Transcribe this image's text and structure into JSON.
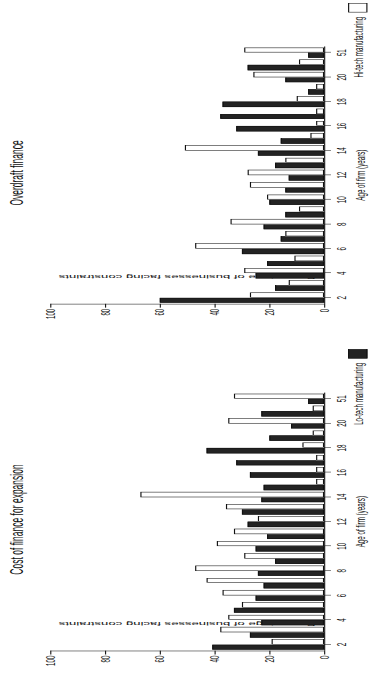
{
  "figure": {
    "panels": [
      {
        "id": "overdraft",
        "title": "Overdraft finance",
        "xlabel": "Age of firm (years)",
        "ylabel": "Percentage of businesses facing constraints",
        "legend": {
          "label": "Hi-tech manufacturing",
          "swatch": "stipple-pattern-swatch"
        }
      },
      {
        "id": "cost-of-finance",
        "title": "Cost of finance for expansion",
        "xlabel": "Age of firm (years)",
        "ylabel": "Percentage of businesses facing constraints",
        "legend": {
          "label": "Lo-tech manufacturing",
          "swatch": "solid-black-swatch"
        }
      }
    ]
  },
  "chart_data": [
    {
      "type": "bar",
      "id": "overdraft",
      "title": "Overdraft finance",
      "xlabel": "Age of firm (years)",
      "ylabel": "Percentage of businesses facing constraints",
      "ylim": [
        0,
        100
      ],
      "yticks": [
        0,
        20,
        40,
        60,
        80,
        100
      ],
      "grid": false,
      "legend_position": "right",
      "categories": [
        "2",
        "3",
        "4",
        "5",
        "6",
        "7",
        "8",
        "9",
        "10",
        "11",
        "12",
        "13",
        "14",
        "15",
        "16",
        "17",
        "18",
        "19",
        "20",
        "21",
        "51"
      ],
      "labelled_ticks": [
        "2",
        "4",
        "6",
        "8",
        "10",
        "12",
        "14",
        "16",
        "18",
        "20",
        "51"
      ],
      "series": [
        {
          "name": "Lo-tech manufacturing",
          "color": "#232323",
          "values": [
            60,
            18,
            25,
            21,
            30,
            16,
            22,
            14,
            20,
            14,
            13,
            18,
            24,
            16,
            32,
            38,
            37,
            6,
            14,
            28,
            6
          ]
        },
        {
          "name": "Hi-tech manufacturing",
          "color": "#ffffff",
          "values": [
            27,
            13,
            29,
            11,
            47,
            14,
            34,
            9,
            21,
            27,
            28,
            14,
            51,
            5,
            3,
            3,
            10,
            3,
            26,
            9,
            29
          ]
        }
      ]
    },
    {
      "type": "bar",
      "id": "cost-of-finance",
      "title": "Cost of finance for expansion",
      "xlabel": "Age of firm (years)",
      "ylabel": "Percentage of businesses facing constraints",
      "ylim": [
        0,
        100
      ],
      "yticks": [
        0,
        20,
        40,
        60,
        80,
        100
      ],
      "grid": false,
      "legend_position": "right",
      "categories": [
        "2",
        "3",
        "4",
        "5",
        "6",
        "7",
        "8",
        "9",
        "10",
        "11",
        "12",
        "13",
        "14",
        "15",
        "16",
        "17",
        "18",
        "19",
        "20",
        "21",
        "51"
      ],
      "labelled_ticks": [
        "2",
        "4",
        "6",
        "8",
        "10",
        "12",
        "14",
        "16",
        "18",
        "20",
        "51"
      ],
      "series": [
        {
          "name": "Lo-tech manufacturing",
          "color": "#232323",
          "values": [
            41,
            27,
            23,
            33,
            25,
            22,
            24,
            18,
            25,
            21,
            28,
            30,
            23,
            22,
            27,
            32,
            43,
            20,
            12,
            23,
            6
          ]
        },
        {
          "name": "Hi-tech manufacturing",
          "color": "#ffffff",
          "values": [
            19,
            38,
            35,
            30,
            37,
            43,
            47,
            29,
            39,
            33,
            24,
            36,
            67,
            3,
            3,
            3,
            8,
            4,
            35,
            4,
            33
          ]
        }
      ]
    }
  ]
}
